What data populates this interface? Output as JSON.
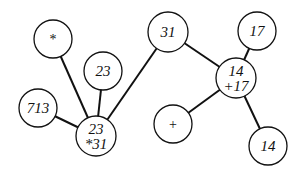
{
  "diagram": {
    "type": "tree",
    "nodes": [
      {
        "id": "n_star",
        "lines": [
          "*"
        ],
        "cx": 53,
        "cy": 39,
        "r": 19,
        "symbol": true
      },
      {
        "id": "n_23_top",
        "lines": [
          "23"
        ],
        "cx": 103,
        "cy": 71,
        "r": 19
      },
      {
        "id": "n_713",
        "lines": [
          "713"
        ],
        "cx": 38,
        "cy": 108,
        "r": 19
      },
      {
        "id": "n_23_31",
        "lines": [
          "23",
          "*31"
        ],
        "cx": 96,
        "cy": 136,
        "r": 20
      },
      {
        "id": "n_31",
        "lines": [
          "31"
        ],
        "cx": 168,
        "cy": 32,
        "r": 20
      },
      {
        "id": "n_17",
        "lines": [
          "17"
        ],
        "cx": 257,
        "cy": 31,
        "r": 19
      },
      {
        "id": "n_14_17",
        "lines": [
          "14",
          "+17"
        ],
        "cx": 236,
        "cy": 78,
        "r": 20
      },
      {
        "id": "n_plus",
        "lines": [
          "+"
        ],
        "cx": 173,
        "cy": 124,
        "r": 19,
        "symbol": true
      },
      {
        "id": "n_14_bottom",
        "lines": [
          "14"
        ],
        "cx": 268,
        "cy": 146,
        "r": 19
      }
    ],
    "edges": [
      {
        "from": "n_star",
        "to": "n_23_31"
      },
      {
        "from": "n_23_top",
        "to": "n_23_31"
      },
      {
        "from": "n_713",
        "to": "n_23_31"
      },
      {
        "from": "n_31",
        "to": "n_23_31"
      },
      {
        "from": "n_31",
        "to": "n_14_17"
      },
      {
        "from": "n_17",
        "to": "n_14_17"
      },
      {
        "from": "n_plus",
        "to": "n_14_17"
      },
      {
        "from": "n_14_bottom",
        "to": "n_14_17"
      }
    ],
    "colors": {
      "stroke": "#111111",
      "fill": "#ffffff",
      "text": "#111111"
    }
  }
}
